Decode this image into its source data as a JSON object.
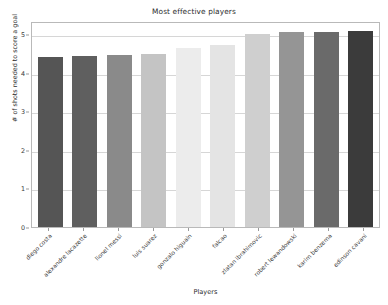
{
  "chart_data": {
    "type": "bar",
    "title": "Most effective players",
    "xlabel": "Players",
    "ylabel": "# of shots needed to score a goal",
    "categories": [
      "diego costa",
      "alexandre lacazette",
      "lionel messi",
      "luis suarez",
      "gonzalo higuain",
      "falcao",
      "zlatan ibrahimovic",
      "robert lewandowski",
      "karim benzema",
      "edinson cavani"
    ],
    "values": [
      4.41,
      4.44,
      4.46,
      4.5,
      4.66,
      4.74,
      5.01,
      5.07,
      5.07,
      5.1
    ],
    "bar_colors": [
      "#555555",
      "#5f5f5f",
      "#8a8a8a",
      "#c4c4c4",
      "#ececec",
      "#e4e4e4",
      "#cfcfcf",
      "#959595",
      "#6a6a6a",
      "#3b3b3b"
    ],
    "ylim": [
      0,
      5.35
    ],
    "yticks": [
      0,
      1,
      2,
      3,
      4,
      5
    ],
    "ytick_labels": [
      "0",
      "1",
      "2",
      "3",
      "4",
      "5"
    ],
    "grid": true,
    "grid_axis": "y",
    "legend": "none",
    "xtick_rotation": -45
  }
}
